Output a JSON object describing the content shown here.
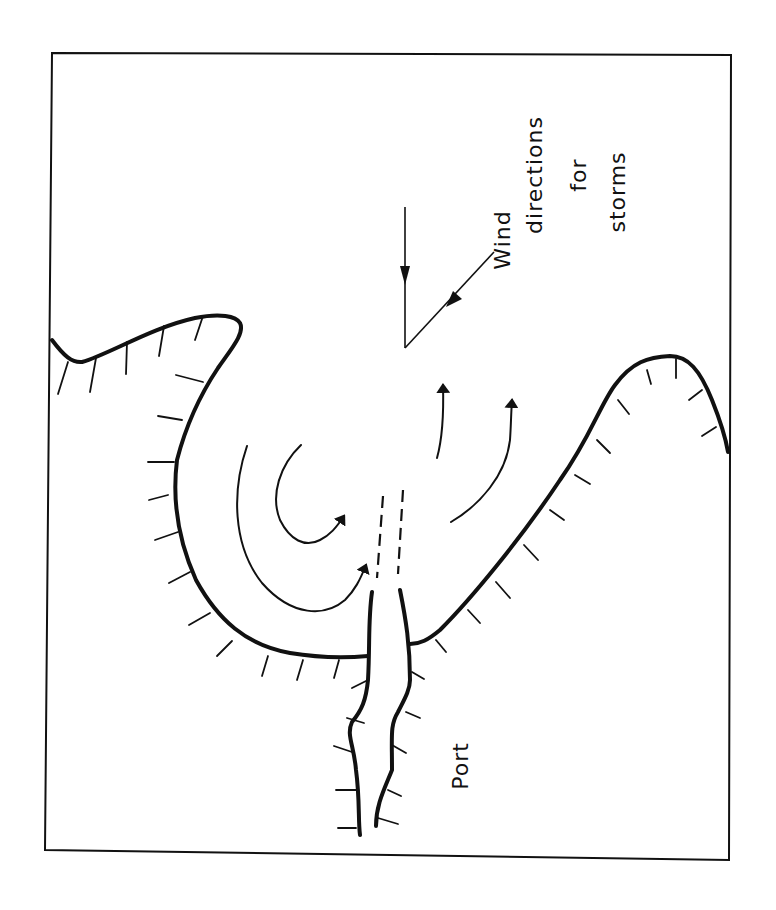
{
  "diagram": {
    "orientation": "rotated 90° (text reads bottom-to-top)",
    "labels": {
      "wind_line1": "Wind",
      "wind_line2": "directions",
      "wind_line3": "for",
      "wind_line4": "storms",
      "port": "Port"
    },
    "elements": {
      "frame": "rectangular border",
      "coastline": "hachured coastline forming a bay",
      "breakwaters": "two dashed breakwater lines at harbor entrance",
      "channel": "narrow port channel with hachured banks",
      "flow_arrows": "curved current/wave arrows within the bay",
      "wind_arrows": "two arrows converging to a point indicating storm wind directions"
    },
    "colors": {
      "ink": "#111111",
      "paper": "#ffffff"
    }
  }
}
